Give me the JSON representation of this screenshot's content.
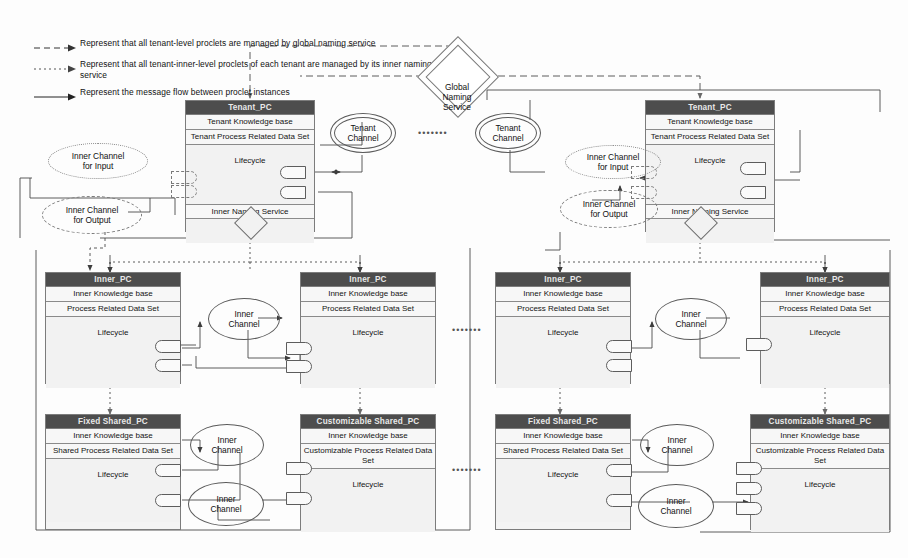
{
  "diagram": {
    "colors": {
      "header_bg": "#4d4d4d",
      "header_text": "#e9e9e9",
      "box_bg": "#f4f4f4",
      "border": "#7c7c7c",
      "line": "#4a4a4a"
    }
  },
  "legend": {
    "items": [
      {
        "style": "dashed",
        "text": "Represent that all tenant-level proclets are managed by global naming service"
      },
      {
        "style": "dotted",
        "text": "Represent that all tenant-inner-level proclets of each tenant are managed by its inner naming service"
      },
      {
        "style": "solid",
        "text": "Represent the message flow between proclet instances"
      }
    ]
  },
  "global_naming_service": {
    "label": "Global\nNaming\nService",
    "line1": "Global",
    "line2": "Naming",
    "line3": "Service"
  },
  "tenant_channels": [
    {
      "label": "Tenant\nChannel",
      "line1": "Tenant",
      "line2": "Channel"
    },
    {
      "label": "Tenant\nChannel",
      "line1": "Tenant",
      "line2": "Channel"
    }
  ],
  "tenants": [
    {
      "id": "tenant-left",
      "pc": {
        "header": "Tenant_PC",
        "knowledge": "Tenant Knowledge base",
        "data_set": "Tenant Process Related Data Set",
        "lifecycle": "Lifecycle",
        "naming": "Inner Naming Service"
      },
      "inner_channel_input": {
        "line1": "Inner Channel",
        "line2": "for Input"
      },
      "inner_channel_output": {
        "line1": "Inner Channel",
        "line2": "for  Output"
      }
    },
    {
      "id": "tenant-right",
      "pc": {
        "header": "Tenant_PC",
        "knowledge": "Tenant Knowledge base",
        "data_set": "Tenant Process Related Data Set",
        "lifecycle": "Lifecycle",
        "naming": "Inner Naming Service"
      },
      "inner_channel_input": {
        "line1": "Inner Channel",
        "line2": "for Input"
      },
      "inner_channel_output": {
        "line1": "Inner Channel",
        "line2": "for  Output"
      }
    }
  ],
  "inner_pcs": [
    {
      "id": "inner-pc-1",
      "header": "Inner_PC",
      "knowledge": "Inner Knowledge base",
      "data_set": "Process Related Data Set",
      "lifecycle": "Lifecycle"
    },
    {
      "id": "inner-pc-2",
      "header": "Inner_PC",
      "knowledge": "Inner Knowledge base",
      "data_set": "Process Related Data Set",
      "lifecycle": "Lifecycle"
    },
    {
      "id": "inner-pc-3",
      "header": "Inner_PC",
      "knowledge": "Inner Knowledge base",
      "data_set": "Process Related Data Set",
      "lifecycle": "Lifecycle"
    },
    {
      "id": "inner-pc-4",
      "header": "Inner_PC",
      "knowledge": "Inner Knowledge base",
      "data_set": "Process Related Data Set",
      "lifecycle": "Lifecycle"
    }
  ],
  "shared_pcs": [
    {
      "id": "fixed-shared-pc-1",
      "header": "Fixed Shared_PC",
      "knowledge": "Inner Knowledge base",
      "data_set": "Shared Process Related Data Set",
      "lifecycle": "Lifecycle"
    },
    {
      "id": "customizable-shared-pc-1",
      "header": "Customizable Shared_PC",
      "knowledge": "Inner Knowledge base",
      "data_set": "Customizable  Process Related Data Set",
      "lifecycle": "Lifecycle"
    },
    {
      "id": "fixed-shared-pc-2",
      "header": "Fixed Shared_PC",
      "knowledge": "Inner Knowledge base",
      "data_set": "Shared Process Related Data Set",
      "lifecycle": "Lifecycle"
    },
    {
      "id": "customizable-shared-pc-2",
      "header": "Customizable Shared_PC",
      "knowledge": "Inner Knowledge base",
      "data_set": "Customizable  Process Related Data Set",
      "lifecycle": "Lifecycle"
    }
  ],
  "inner_channels": [
    {
      "id": "ic-1",
      "line1": "Inner",
      "line2": "Channel"
    },
    {
      "id": "ic-2",
      "line1": "Inner",
      "line2": "Channel"
    },
    {
      "id": "ic-3",
      "line1": "Inner",
      "line2": "Channel"
    },
    {
      "id": "ic-4",
      "line1": "Inner",
      "line2": "Channel"
    },
    {
      "id": "ic-5",
      "line1": "Inner",
      "line2": "Channel"
    },
    {
      "id": "ic-6",
      "line1": "Inner",
      "line2": "Channel"
    }
  ],
  "ellipses": {
    "glyph": "•••••••"
  }
}
